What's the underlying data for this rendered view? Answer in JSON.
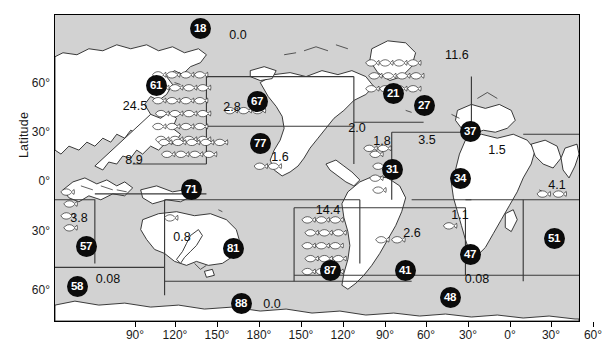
{
  "figure": {
    "type": "map",
    "axes": {
      "ylabel": "Latitude",
      "y_ticks": [
        {
          "label": "60°",
          "y": 84
        },
        {
          "label": "30°",
          "y": 133
        },
        {
          "label": "0°",
          "y": 182
        },
        {
          "label": "30°",
          "y": 232
        },
        {
          "label": "60°",
          "y": 291
        }
      ],
      "x_ticks": [
        {
          "label": "90°",
          "x": 81
        },
        {
          "label": "120°",
          "x": 121
        },
        {
          "label": "150°",
          "x": 163
        },
        {
          "label": "180°",
          "x": 205
        },
        {
          "label": "150°",
          "x": 247
        },
        {
          "label": "120°",
          "x": 289
        },
        {
          "label": "90°",
          "x": 331
        },
        {
          "label": "60°",
          "x": 372
        },
        {
          "label": "30°",
          "x": 414
        },
        {
          "label": "0°",
          "x": 456
        },
        {
          "label": "30°",
          "x": 497
        },
        {
          "label": "60°",
          "x": 539
        }
      ]
    },
    "regions": [
      {
        "id": "18",
        "badge": "18",
        "bx": 199,
        "by": 27,
        "value": "0.0",
        "vx": 237,
        "vy": 34,
        "fish": 0
      },
      {
        "id": "61",
        "badge": "61",
        "bx": 155,
        "by": 84,
        "value": "24.5",
        "vx": 134,
        "vy": 105,
        "fish": 24
      },
      {
        "id": "67",
        "badge": "67",
        "bx": 256,
        "by": 100,
        "value": "2.8",
        "vx": 231,
        "vy": 106,
        "fish": 3
      },
      {
        "id": "77",
        "badge": "77",
        "bx": 259,
        "by": 142,
        "value": "1.6",
        "vx": 279,
        "vy": 156,
        "fish": 2
      },
      {
        "id": "71",
        "badge": "71",
        "bx": 190,
        "by": 188,
        "value": "8.9",
        "vx": 133,
        "vy": 159,
        "fish": 9
      },
      {
        "id": "21",
        "badge": "21",
        "bx": 392,
        "by": 92,
        "value": "11.6",
        "vx": 456,
        "vy": 54,
        "fish": 12
      },
      {
        "id": "27",
        "badge": "27",
        "bx": 423,
        "by": 104,
        "value": "",
        "vx": 0,
        "vy": 0,
        "fish": 0
      },
      {
        "id": "31",
        "badge": "31",
        "bx": 391,
        "by": 168,
        "value": "1.8",
        "vx": 381,
        "vy": 140,
        "fish": 2
      },
      {
        "id": "37",
        "badge": "37",
        "bx": 469,
        "by": 130,
        "value": "1.5",
        "vx": 496,
        "vy": 149,
        "fish": 0
      },
      {
        "id": "34",
        "badge": "34",
        "bx": 459,
        "by": 177,
        "value": "3.5",
        "vx": 426,
        "vy": 139,
        "fish": 4
      },
      {
        "id": "57",
        "badge": "57",
        "bx": 85,
        "by": 245,
        "value": "3.8",
        "vx": 78,
        "vy": 217,
        "fish": 4
      },
      {
        "id": "81",
        "badge": "81",
        "bx": 232,
        "by": 247,
        "value": "0.8",
        "vx": 181,
        "vy": 236,
        "fish": 1
      },
      {
        "id": "87",
        "badge": "87",
        "bx": 329,
        "by": 269,
        "value": "14.4",
        "vx": 327,
        "vy": 209,
        "fish": 15
      },
      {
        "id": "41",
        "badge": "41",
        "bx": 404,
        "by": 269,
        "value": "2.6",
        "vx": 411,
        "vy": 232,
        "fish": 3
      },
      {
        "id": "47",
        "badge": "47",
        "bx": 469,
        "by": 253,
        "value": "1.1",
        "vx": 459,
        "vy": 214,
        "fish": 1
      },
      {
        "id": "51",
        "badge": "51",
        "bx": 553,
        "by": 237,
        "value": "4.1",
        "vx": 556,
        "vy": 184,
        "fish": 4
      },
      {
        "id": "58",
        "badge": "58",
        "bx": 76,
        "by": 285,
        "value": "0.08",
        "vx": 107,
        "vy": 278,
        "fish": 0
      },
      {
        "id": "48",
        "badge": "48",
        "bx": 449,
        "by": 296,
        "value": "0.08",
        "vx": 476,
        "vy": 278,
        "fish": 0
      },
      {
        "id": "88",
        "badge": "88",
        "bx": 240,
        "by": 302,
        "value": "0.0",
        "vx": 271,
        "vy": 303,
        "fish": 0
      },
      {
        "id": "extra20",
        "badge": "",
        "bx": 0,
        "by": 0,
        "value": "2.0",
        "vx": 356,
        "vy": 127,
        "fish": 2
      }
    ],
    "colors": {
      "ocean": "#d2d2d2",
      "land": "#ffffff",
      "badge": "#0b0b0b",
      "badge_text": "#ffffff",
      "line": "#1a1a1a"
    }
  }
}
